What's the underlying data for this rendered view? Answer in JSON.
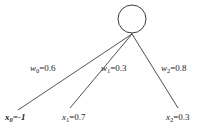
{
  "diagram": {
    "type": "perceptron-input-diagram",
    "background_color": "#ffffff",
    "stroke_color": "#3a3a3a",
    "text_color": "#1a1a1a",
    "node": {
      "name": "output-neuron",
      "shape": "circle",
      "center_x": 132,
      "center_y": 19,
      "radius": 14,
      "label": ""
    },
    "junction": {
      "x": 132,
      "y": 34
    },
    "edges": [
      {
        "id": "w0",
        "weight_label": {
          "symbol": "w",
          "subscript": "0",
          "equals": "=",
          "value": "0.6",
          "full": "w0=0.6"
        },
        "from": {
          "x": 18,
          "y": 110
        },
        "to": {
          "x": 132,
          "y": 34
        }
      },
      {
        "id": "w1",
        "weight_label": {
          "symbol": "w",
          "subscript": "1",
          "equals": "=",
          "value": "0.3",
          "full": "w1=0.3"
        },
        "from": {
          "x": 70,
          "y": 108
        },
        "to": {
          "x": 132,
          "y": 34
        }
      },
      {
        "id": "w2",
        "weight_label": {
          "symbol": "w",
          "subscript": "2",
          "equals": "=",
          "value": "0.8",
          "full": "w2=0.8"
        },
        "from": {
          "x": 178,
          "y": 108
        },
        "to": {
          "x": 132,
          "y": 34
        }
      }
    ],
    "inputs": [
      {
        "id": "x0",
        "symbol": "x",
        "subscript": "0",
        "equals": "=",
        "value": "-1",
        "full": "x0=-1",
        "emphasis": "bold-italic"
      },
      {
        "id": "x1",
        "symbol": "x",
        "subscript": "1",
        "equals": "=",
        "value": "0.7",
        "full": "x1=0.7",
        "emphasis": "normal"
      },
      {
        "id": "x2",
        "symbol": "x",
        "subscript": "2",
        "equals": "=",
        "value": "0.3",
        "full": "x2=0.3",
        "emphasis": "normal"
      }
    ]
  }
}
